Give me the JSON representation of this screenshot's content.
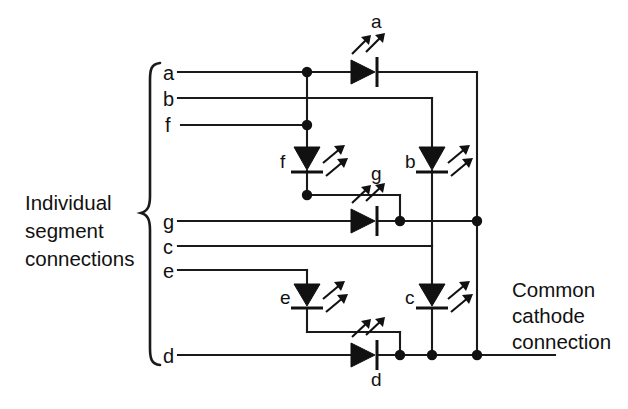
{
  "figure": {
    "background_color": "#ffffff",
    "line_color": "#1a1a1a"
  },
  "captions": {
    "left": {
      "name": "individual-segment-connections",
      "lines": [
        "Individual",
        "segment",
        "connections"
      ],
      "x": 25,
      "y": 196
    },
    "right": {
      "name": "common-cathode-connection",
      "lines": [
        "Common",
        "cathode",
        "connection"
      ],
      "x": 512,
      "y": 283
    }
  },
  "brace": {
    "name": "segment-brace",
    "top": 62,
    "bottom": 366,
    "x": 150
  },
  "pins": [
    {
      "id": "a",
      "label": "a",
      "y": 72,
      "label_x": 163,
      "wire_x1": 178,
      "wire_x2": 477
    },
    {
      "id": "b",
      "label": "b",
      "y": 98,
      "label_x": 163,
      "wire_x1": 178,
      "wire_x2": 432
    },
    {
      "id": "f",
      "label": "f",
      "y": 125,
      "label_x": 164,
      "wire_x1": 181,
      "wire_x2": 307
    },
    {
      "id": "g",
      "label": "g",
      "y": 221,
      "label_x": 163,
      "wire_x1": 178,
      "wire_x2": 477
    },
    {
      "id": "c",
      "label": "c",
      "y": 246,
      "label_x": 163,
      "wire_x1": 178,
      "wire_x2": 432
    },
    {
      "id": "e",
      "label": "e",
      "y": 270,
      "label_x": 163,
      "wire_x1": 178,
      "wire_x2": 307
    },
    {
      "id": "d",
      "label": "d",
      "y": 355,
      "label_x": 163,
      "wire_x1": 178,
      "wire_x2": 555
    }
  ],
  "leds": [
    {
      "id": "a",
      "label": "a",
      "orientation": "right",
      "x": 370,
      "y": 72,
      "label_x": 378,
      "label_y": 38,
      "label_pos": "above"
    },
    {
      "id": "b",
      "label": "b",
      "orientation": "down",
      "x": 432,
      "y": 160,
      "label_x": 413,
      "label_y": 167,
      "label_pos": "left"
    },
    {
      "id": "f",
      "label": "f",
      "orientation": "down",
      "x": 307,
      "y": 160,
      "label_x": 288,
      "label_y": 167,
      "label_pos": "left"
    },
    {
      "id": "g",
      "label": "g",
      "orientation": "right",
      "x": 370,
      "y": 221,
      "label_x": 378,
      "label_y": 188,
      "label_pos": "above"
    },
    {
      "id": "c",
      "label": "c",
      "orientation": "down",
      "x": 432,
      "y": 297,
      "label_x": 413,
      "label_y": 304,
      "label_pos": "left"
    },
    {
      "id": "e",
      "label": "e",
      "orientation": "down",
      "x": 307,
      "y": 297,
      "label_x": 288,
      "label_y": 304,
      "label_pos": "left"
    },
    {
      "id": "d",
      "label": "d",
      "orientation": "right",
      "x": 370,
      "y": 355,
      "label_x": 378,
      "label_y": 380,
      "label_pos": "below"
    }
  ],
  "junction_dots": [
    {
      "name": "dot-a-branch",
      "x": 307,
      "y": 72
    },
    {
      "name": "dot-f-branch",
      "x": 307,
      "y": 125
    },
    {
      "name": "dot-f-cathode",
      "x": 307,
      "y": 195
    },
    {
      "name": "dot-g-anode-tap",
      "x": 400,
      "y": 221
    },
    {
      "name": "dot-g-bus",
      "x": 477,
      "y": 221
    },
    {
      "name": "dot-d-anode-tap",
      "x": 400,
      "y": 355
    },
    {
      "name": "dot-d-b-column",
      "x": 432,
      "y": 355
    },
    {
      "name": "dot-d-bus",
      "x": 477,
      "y": 355
    }
  ],
  "bus": {
    "name": "common-cathode-bus",
    "x": 477,
    "y_top": 72,
    "y_bottom": 355
  },
  "segment_network": [
    {
      "segment": "a",
      "path": "pin a rail to anode of LED a, cathode to common bus"
    },
    {
      "segment": "b",
      "path": "pin b rail down column x=432 to anode of LED b, cathode to bus at d rail"
    },
    {
      "segment": "f",
      "path": "pin f rail to anode of LED f, cathode joins g anode tap"
    },
    {
      "segment": "g",
      "path": "pin g rail to anode of LED g, cathode to bus at x=477"
    },
    {
      "segment": "c",
      "path": "pin c rail down column x=432 to anode of LED c, cathode to d rail"
    },
    {
      "segment": "e",
      "path": "pin e rail to anode of LED e, cathode joins d anode tap"
    },
    {
      "segment": "d",
      "path": "pin d rail to anode of LED d, cathode to bus"
    }
  ]
}
